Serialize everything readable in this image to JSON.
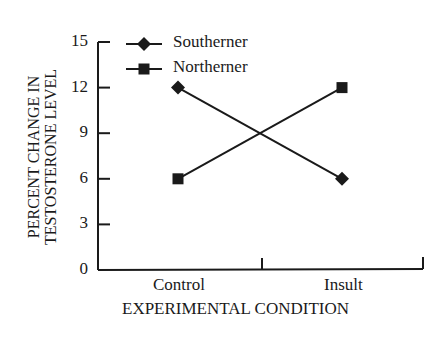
{
  "chart_data": {
    "type": "line",
    "title": "",
    "xlabel": "EXPERIMENTAL CONDITION",
    "ylabel": "PERCENT CHANGE IN TESTOSTERONE LEVEL",
    "ylabel_lines": [
      "PERCENT CHANGE IN",
      "TESTOSTERONE LEVEL"
    ],
    "categories": [
      "Control",
      "Insult"
    ],
    "yticks": [
      0,
      3,
      6,
      9,
      12,
      15
    ],
    "ylim": [
      0,
      15
    ],
    "grid": false,
    "legend_position": "top-left inside",
    "series": [
      {
        "name": "Southerner",
        "marker": "diamond",
        "values": [
          12,
          6
        ]
      },
      {
        "name": "Northerner",
        "marker": "square",
        "values": [
          6,
          12
        ]
      }
    ]
  },
  "colors": {
    "ink": "#1a1a1a",
    "background": "#ffffff"
  }
}
